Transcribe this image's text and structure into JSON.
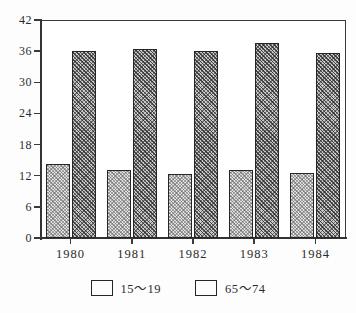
{
  "chart_data": {
    "type": "bar",
    "title": "",
    "xlabel": "",
    "ylabel": "",
    "categories": [
      "1980",
      "1981",
      "1982",
      "1983",
      "1984"
    ],
    "series": [
      {
        "name": "15〜19",
        "values": [
          14.3,
          13.1,
          12.3,
          13.1,
          12.5
        ],
        "color": "#e2e2e2"
      },
      {
        "name": "65〜74",
        "values": [
          36.0,
          36.4,
          36.0,
          37.5,
          35.6
        ],
        "color": "#c9c9c9"
      }
    ],
    "ylim": [
      0,
      42
    ],
    "yticks": [
      "0",
      "6",
      "12",
      "18",
      "24",
      "30",
      "36",
      "42"
    ],
    "ytick_values": [
      0,
      6,
      12,
      18,
      24,
      30,
      36,
      42
    ],
    "grid": false,
    "legend_position": "bottom"
  },
  "legend": {
    "items": [
      {
        "label": "15〜19",
        "swatch": "light-hatch-swatch"
      },
      {
        "label": "65〜74",
        "swatch": "dark-hatch-swatch"
      }
    ]
  }
}
